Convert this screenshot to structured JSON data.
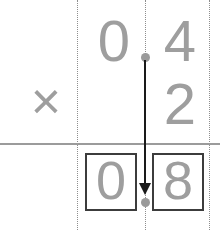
{
  "problem": {
    "type": "decimal-multiplication",
    "multiplicand": "0.4",
    "multiplier": "2",
    "product": "0.8",
    "operator_symbol": "×"
  },
  "operand_row_1": {
    "ones_digit": "0",
    "decimal_point": "•",
    "tenths_digit": "4"
  },
  "operand_row_2": {
    "operator": "×",
    "ones_digit": "2"
  },
  "answer_row": {
    "box_1_value": "0",
    "decimal_point": "•",
    "box_2_value": "8"
  },
  "annotation": {
    "arrow_label": "decimal-point-placement-arrow",
    "direction": "down"
  },
  "colors": {
    "digit_gray": "#9e9e9e",
    "rule_gray": "#9b9b9b",
    "guide_gray": "#8e8e8e",
    "box_border": "#3c3c3c",
    "arrow_dark": "#1a1a1a",
    "dot_gray": "#9a9a9a",
    "background": "#ffffff"
  }
}
